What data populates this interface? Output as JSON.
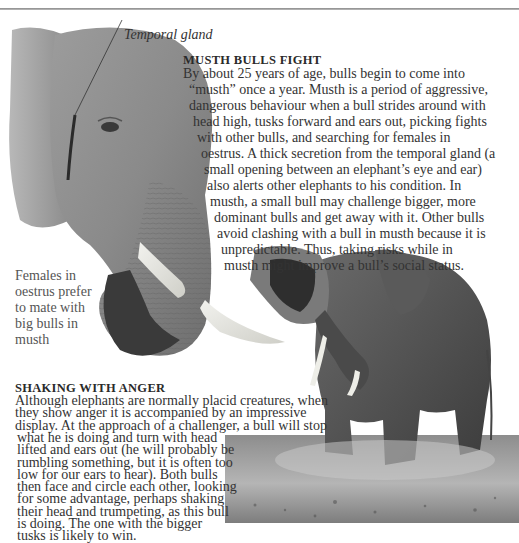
{
  "page": {
    "background": "#ffffff",
    "rule_color": "#8a8a8a"
  },
  "head_photo": {
    "alt": "Close-up of a bull elephant head with trunk curled and tusks, secretion from temporal gland visible",
    "label": "Temporal gland"
  },
  "musth_section": {
    "heading": "MUSTH BULLS FIGHT",
    "lines": [
      "By about 25 years of age, bulls begin to come into",
      "“musth” once a year. Musth is a period of aggressive,",
      "dangerous behaviour when a bull strides around with",
      "head high, tusks forward and ears out, picking fights",
      "with other bulls, and searching for females in",
      "oestrus. A thick secretion from the temporal gland (a",
      "small opening between an elephant’s eye and ear)",
      "also alerts other elephants to his condition. In",
      "musth, a small bull may challenge bigger, more",
      "dominant bulls and get away with it. Other bulls",
      "avoid clashing with a bull in musth because it is",
      "unpredictable. Thus, taking risks while in",
      "musth might improve a bull’s social status."
    ]
  },
  "side_caption": {
    "lines": [
      "Females in",
      "oestrus prefer",
      "to mate with",
      "big bulls in",
      "musth"
    ]
  },
  "anger_section": {
    "heading": "SHAKING WITH ANGER",
    "lines": [
      "Although elephants are normally placid creatures, when",
      "they show anger it is accompanied by an impressive",
      "display. At the approach of a challenger, a bull will stop",
      "what he is doing and turn with head",
      "lifted and ears out (he will probably be",
      "rumbling something, but it is often too",
      "low for our ears to hear). Both bulls",
      "then face and circle each other, looking",
      "for some advantage, perhaps shaking",
      "their head and trumpeting, as this bull",
      "is doing. The one with the bigger",
      "tusks is likely to win."
    ]
  },
  "charging_photo": {
    "alt": "Bull elephant shaking its head and trumpeting, kicking up dust on dry ground"
  }
}
